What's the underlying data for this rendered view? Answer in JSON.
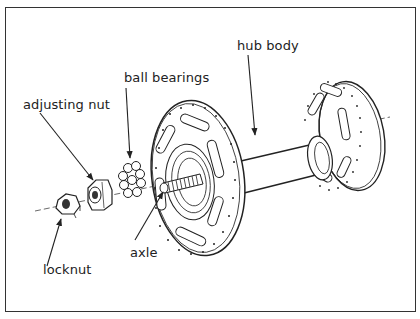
{
  "diagram": {
    "type": "exploded-view",
    "labels": {
      "hub_body": "hub body",
      "ball_bearings": "ball bearings",
      "adjusting_nut": "adjusting nut",
      "axle": "axle",
      "locknut": "locknut"
    },
    "colors": {
      "line": "#222222",
      "background": "#ffffff",
      "frame": "#333333"
    }
  }
}
